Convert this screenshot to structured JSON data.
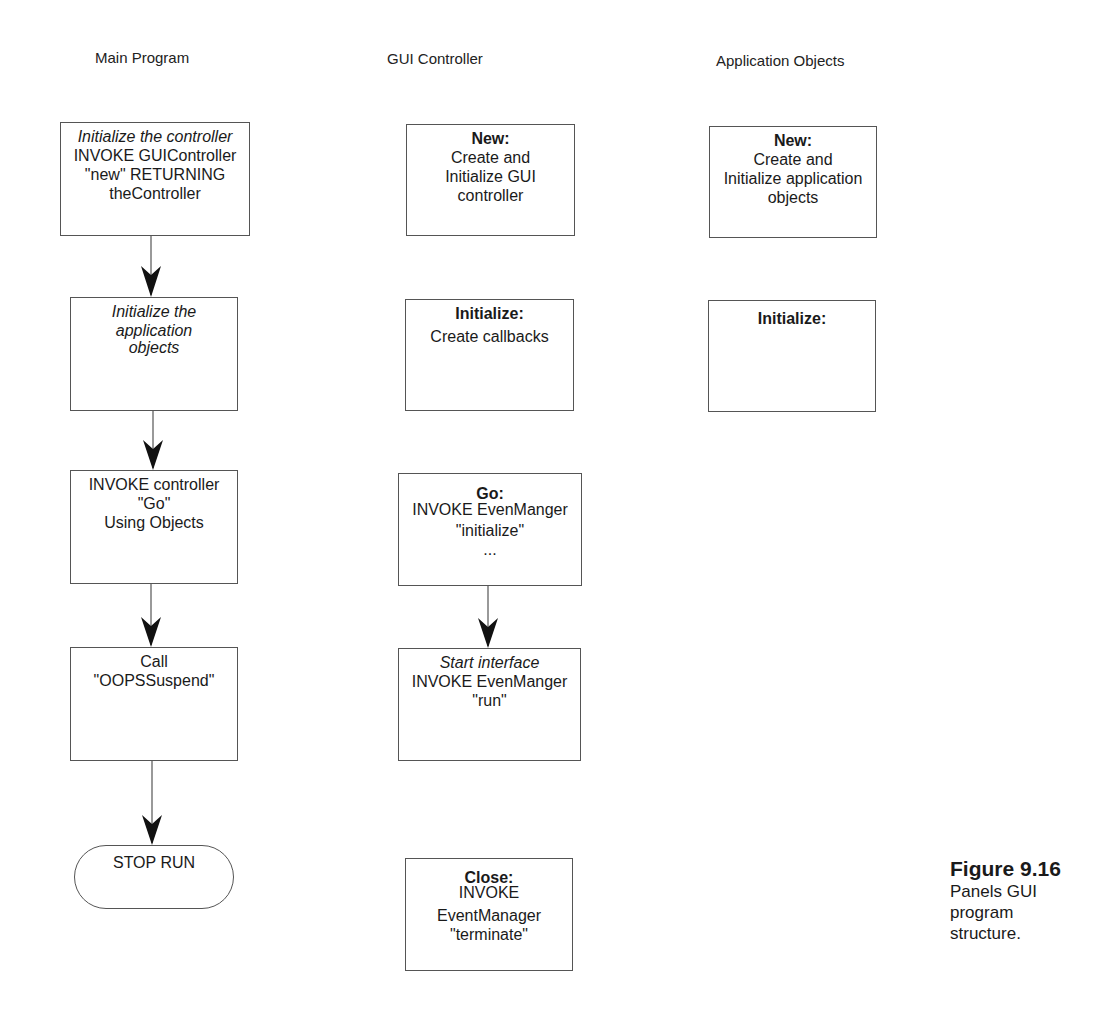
{
  "columns": {
    "main": "Main Program",
    "gui": "GUI Controller",
    "app": "Application Objects"
  },
  "main_boxes": [
    {
      "lines": [
        "Initialize the controller",
        "INVOKE GUIController",
        "\"new\" RETURNING",
        "theController"
      ]
    },
    {
      "lines": [
        "Initialize the",
        "application",
        "objects"
      ]
    },
    {
      "lines": [
        "INVOKE controller",
        "\"Go\"",
        "Using Objects"
      ]
    },
    {
      "lines": [
        "Call",
        "\"OOPSSuspend\""
      ]
    }
  ],
  "terminal": "STOP RUN",
  "gui_boxes": [
    {
      "lines": [
        "New:",
        "Create and",
        "Initialize GUI",
        "controller"
      ]
    },
    {
      "lines": [
        "Initialize:",
        "Create callbacks"
      ]
    },
    {
      "lines": [
        "Go:",
        "INVOKE EvenManger",
        "\"initialize\"",
        "..."
      ]
    },
    {
      "lines": [
        "Start interface",
        "INVOKE EvenManger",
        "\"run\""
      ]
    },
    {
      "lines": [
        "Close:",
        "INVOKE",
        "EventManager",
        "\"terminate\""
      ]
    }
  ],
  "app_boxes": [
    {
      "lines": [
        "New:",
        "Create and",
        "Initialize application",
        "objects"
      ]
    },
    {
      "lines": [
        "Initialize:"
      ]
    }
  ],
  "caption": {
    "figure": "Figure 9.16",
    "text": "Panels GUI program structure."
  },
  "colors": {
    "line": "#555555",
    "arrowhead": "#111111",
    "text": "#1a1a1a"
  }
}
